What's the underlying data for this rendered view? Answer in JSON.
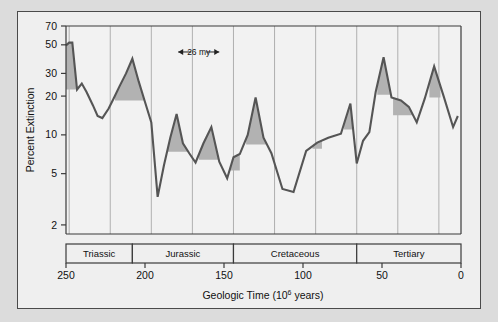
{
  "figure": {
    "background_color": "#dcdcdc",
    "frame_color": "#4a4a4a",
    "plot_background": "#f2f2f2"
  },
  "axes": {
    "y_title": "Percent Extinction",
    "x_title_main": "Geologic Time (10",
    "x_title_sup": "6",
    "x_title_tail": " years)",
    "y_ticks": [
      2,
      5,
      10,
      20,
      30,
      50,
      70
    ],
    "y_tick_labels": [
      "2",
      "5",
      "10",
      "20",
      "30",
      "50",
      "70"
    ],
    "x_ticks": [
      250,
      200,
      150,
      100,
      50,
      0
    ],
    "x_tick_labels": [
      "250",
      "200",
      "150",
      "100",
      "50",
      "0"
    ]
  },
  "periods": [
    {
      "label": "Triassic",
      "start": 250,
      "end": 208
    },
    {
      "label": "Jurassic",
      "start": 208,
      "end": 144
    },
    {
      "label": "Cretaceous",
      "start": 144,
      "end": 66
    },
    {
      "label": "Tertiary",
      "start": 66,
      "end": 0
    }
  ],
  "annotation": {
    "label": "26 my",
    "from_x": 179,
    "to_x": 153,
    "y_value": 44,
    "icon_left": "arrow-left-icon",
    "icon_right": "arrow-right-icon"
  },
  "chart_data": {
    "type": "line",
    "title": "",
    "xlabel": "Geologic Time (10^6 years)",
    "ylabel": "Percent Extinction",
    "xlim": [
      250,
      0
    ],
    "xaxis_reversed": true,
    "yscale": "log",
    "ylim": [
      1.7,
      70
    ],
    "grid": "vertical gridlines at 26-million-year periodic spacing",
    "legend": "none",
    "grid_lines_x": [
      248,
      222,
      196,
      170,
      144,
      118,
      92,
      66,
      40,
      14
    ],
    "series": [
      {
        "name": "Percent extinction of marine genera",
        "x": [
          250,
          248,
          246,
          243,
          240,
          237,
          233,
          230,
          227,
          223,
          220,
          216,
          212,
          208,
          204,
          200,
          196,
          192,
          188,
          184,
          180,
          176,
          172,
          168,
          163,
          158,
          153,
          148,
          144,
          140,
          135,
          130,
          125,
          120,
          113,
          106,
          98,
          91,
          84,
          76,
          70,
          66,
          62,
          58,
          54,
          49,
          44,
          38,
          33,
          28,
          23,
          17,
          11,
          5,
          2
        ],
        "y": [
          49.5,
          52.0,
          52.0,
          22.5,
          25.0,
          21.5,
          17.0,
          14.0,
          13.5,
          16.0,
          19.0,
          24.0,
          30.0,
          39.0,
          26.0,
          18.0,
          12.5,
          3.3,
          5.8,
          9.5,
          14.5,
          8.6,
          7.2,
          6.1,
          8.6,
          11.5,
          6.2,
          4.6,
          6.7,
          7.1,
          10.0,
          19.5,
          9.5,
          7.2,
          3.8,
          3.6,
          7.5,
          8.7,
          9.5,
          10.2,
          17.5,
          6.0,
          9.0,
          10.5,
          21.5,
          40.0,
          19.5,
          18.5,
          16.5,
          12.5,
          19.0,
          34.0,
          20.0,
          11.5,
          14.0
        ]
      }
    ],
    "shaded_peaks": [
      {
        "peak_x": 248,
        "peak_y": 52.0,
        "baseline_y": 22.5,
        "left_x": 250,
        "right_x": 243
      },
      {
        "peak_x": 208,
        "peak_y": 39.0,
        "baseline_y": 18.5,
        "left_x": 219,
        "right_x": 197
      },
      {
        "peak_x": 180,
        "peak_y": 14.5,
        "baseline_y": 7.4,
        "left_x": 187,
        "right_x": 173
      },
      {
        "peak_x": 158,
        "peak_y": 11.5,
        "baseline_y": 6.4,
        "left_x": 166,
        "right_x": 152
      },
      {
        "peak_x": 144,
        "peak_y": 6.7,
        "baseline_y": 5.3,
        "left_x": 148,
        "right_x": 140
      },
      {
        "peak_x": 130,
        "peak_y": 19.5,
        "baseline_y": 8.4,
        "left_x": 136,
        "right_x": 123
      },
      {
        "peak_x": 91,
        "peak_y": 8.7,
        "baseline_y": 7.8,
        "left_x": 94,
        "right_x": 88
      },
      {
        "peak_x": 70,
        "peak_y": 17.5,
        "baseline_y": 11.0,
        "left_x": 74,
        "right_x": 67
      },
      {
        "peak_x": 49,
        "peak_y": 40.0,
        "baseline_y": 20.5,
        "left_x": 53,
        "right_x": 45
      },
      {
        "peak_x": 38,
        "peak_y": 18.5,
        "baseline_y": 14.2,
        "left_x": 43,
        "right_x": 31
      },
      {
        "peak_x": 17,
        "peak_y": 34.0,
        "baseline_y": 19.5,
        "left_x": 20,
        "right_x": 13
      }
    ],
    "annotations": [
      {
        "text": "26 my",
        "type": "double-headed-arrow",
        "x_from": 179,
        "x_to": 153,
        "y": 44
      }
    ]
  }
}
